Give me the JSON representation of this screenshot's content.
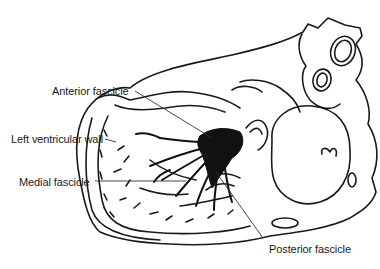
{
  "diagram": {
    "colors": {
      "ink": "#1a1a1a",
      "background": "#ffffff",
      "leader": "#555555"
    },
    "labels": [
      {
        "id": "anterior",
        "text": "Anterior fascicle",
        "x": 52,
        "y": 85
      },
      {
        "id": "lv_wall",
        "text": "Left ventricular wall",
        "x": 11,
        "y": 133
      },
      {
        "id": "medial",
        "text": "Medial fascicle",
        "x": 19,
        "y": 176
      },
      {
        "id": "posterior",
        "text": "Posterior fascicle",
        "x": 269,
        "y": 243
      }
    ]
  }
}
